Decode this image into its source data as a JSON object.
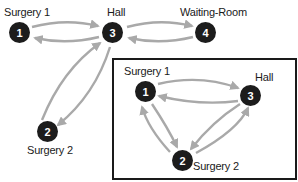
{
  "colors": {
    "node_fill": "#1c1c1c",
    "node_text": "#ffffff",
    "edge": "#a9a9a9",
    "box_border": "#1a1a1a"
  },
  "graph_top": {
    "nodes": [
      {
        "id": "1",
        "label": "Surgery 1"
      },
      {
        "id": "2",
        "label": "Surgery 2"
      },
      {
        "id": "3",
        "label": "Hall"
      },
      {
        "id": "4",
        "label": "Waiting-Room"
      }
    ],
    "edges": [
      {
        "from": "1",
        "to": "3"
      },
      {
        "from": "3",
        "to": "1"
      },
      {
        "from": "3",
        "to": "4"
      },
      {
        "from": "4",
        "to": "3"
      },
      {
        "from": "2",
        "to": "3"
      },
      {
        "from": "3",
        "to": "2"
      }
    ]
  },
  "graph_inset": {
    "nodes": [
      {
        "id": "1",
        "label": "Surgery 1"
      },
      {
        "id": "2",
        "label": "Surgery 2"
      },
      {
        "id": "3",
        "label": "Hall"
      }
    ],
    "edges": [
      {
        "from": "1",
        "to": "3"
      },
      {
        "from": "3",
        "to": "1"
      },
      {
        "from": "1",
        "to": "2"
      },
      {
        "from": "2",
        "to": "1"
      },
      {
        "from": "2",
        "to": "3"
      },
      {
        "from": "3",
        "to": "2"
      }
    ]
  }
}
